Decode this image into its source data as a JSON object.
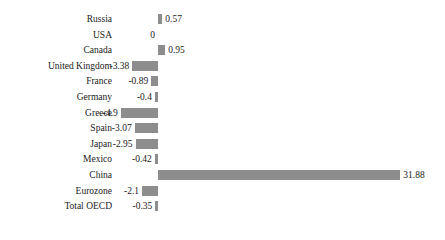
{
  "chart_data": {
    "type": "bar",
    "orientation": "horizontal",
    "title": "",
    "subtitle": "",
    "xlabel": "",
    "ylabel": "",
    "grid": false,
    "legend": false,
    "axis_visible": false,
    "zero_line": 0,
    "xlim": [
      -4.9,
      31.88
    ],
    "bar_color": "#8d8d8d",
    "text_color": "#1a1a1a",
    "background_color": "#ffffff",
    "categories": [
      "Russia",
      "USA",
      "Canada",
      "United Kingdom",
      "France",
      "Germany",
      "Greece",
      "Spain",
      "Japan",
      "Mexico",
      "China",
      "Eurozone",
      "Total OECD"
    ],
    "values": [
      0.57,
      0,
      0.95,
      -3.38,
      -0.89,
      -0.4,
      -4.9,
      -3.07,
      -2.95,
      -0.42,
      31.88,
      -2.1,
      -0.35
    ],
    "value_labels": [
      "0.57",
      "0",
      "0.95",
      "-3.38",
      "-0.89",
      "-0.4",
      "-4.9",
      "-3.07",
      "-2.95",
      "-0.42",
      "31.88",
      "-2.1",
      "-0.35"
    ]
  }
}
